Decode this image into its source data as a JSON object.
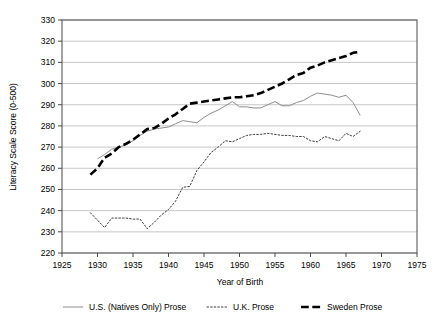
{
  "chart_data": {
    "type": "line",
    "title": "",
    "xlabel": "Year of Birth",
    "ylabel": "Literacy Scale Score (0-500)",
    "xlim": [
      1925,
      1975
    ],
    "ylim": [
      220,
      330
    ],
    "xticks": [
      1925,
      1930,
      1935,
      1940,
      1945,
      1950,
      1955,
      1960,
      1965,
      1970,
      1975
    ],
    "yticks": [
      220,
      230,
      240,
      250,
      260,
      270,
      280,
      290,
      300,
      310,
      320,
      330
    ],
    "grid": "horizontal",
    "legend_position": "bottom",
    "series": [
      {
        "name": "U.S. (Natives Only) Prose",
        "style": "solid",
        "color": "#808080",
        "width": 0.9,
        "x": [
          1930,
          1931,
          1932,
          1933,
          1934,
          1935,
          1936,
          1937,
          1938,
          1939,
          1940,
          1941,
          1942,
          1943,
          1944,
          1945,
          1946,
          1947,
          1948,
          1949,
          1950,
          1951,
          1952,
          1953,
          1954,
          1955,
          1956,
          1957,
          1958,
          1959,
          1960,
          1961,
          1962,
          1963,
          1964,
          1965,
          1966,
          1967
        ],
        "y": [
          264.5,
          266.5,
          269.0,
          270.0,
          271.0,
          273.0,
          275.5,
          277.5,
          278.5,
          279.0,
          279.5,
          281.0,
          282.5,
          282.0,
          281.5,
          284.0,
          286.0,
          287.5,
          289.5,
          291.5,
          289.0,
          289.0,
          288.5,
          288.5,
          290.0,
          291.5,
          289.5,
          289.5,
          291.0,
          292.0,
          294.0,
          295.5,
          295.0,
          294.5,
          293.5,
          294.5,
          291.0,
          285.0
        ]
      },
      {
        "name": "U.K. Prose",
        "style": "dotted",
        "color": "#3a3a3a",
        "width": 1.0,
        "x": [
          1929,
          1930,
          1931,
          1932,
          1933,
          1934,
          1935,
          1936,
          1937,
          1938,
          1939,
          1940,
          1941,
          1942,
          1943,
          1944,
          1945,
          1946,
          1947,
          1948,
          1949,
          1950,
          1951,
          1952,
          1953,
          1954,
          1955,
          1956,
          1957,
          1958,
          1959,
          1960,
          1961,
          1962,
          1963,
          1964,
          1965,
          1966,
          1967
        ],
        "y": [
          239.0,
          235.5,
          232.0,
          236.5,
          236.5,
          236.5,
          236.0,
          236.0,
          231.5,
          234.5,
          238.0,
          240.5,
          244.5,
          251.0,
          251.5,
          259.0,
          263.0,
          267.5,
          270.0,
          273.0,
          272.5,
          274.0,
          275.5,
          276.0,
          276.0,
          276.5,
          276.0,
          275.5,
          275.5,
          275.0,
          275.0,
          273.0,
          272.5,
          275.0,
          274.0,
          273.0,
          276.5,
          275.0,
          277.5
        ]
      },
      {
        "name": "Sweden Prose",
        "style": "dashed",
        "color": "#000000",
        "width": 2.6,
        "x": [
          1929,
          1930,
          1931,
          1932,
          1933,
          1934,
          1935,
          1936,
          1937,
          1938,
          1939,
          1940,
          1941,
          1942,
          1943,
          1944,
          1945,
          1946,
          1947,
          1948,
          1949,
          1950,
          1951,
          1952,
          1953,
          1954,
          1955,
          1956,
          1957,
          1958,
          1959,
          1960,
          1961,
          1962,
          1963,
          1964,
          1965,
          1966,
          1967
        ],
        "y": [
          257.0,
          260.0,
          265.0,
          267.0,
          270.0,
          271.5,
          273.5,
          276.0,
          278.5,
          279.0,
          281.0,
          283.5,
          285.5,
          288.0,
          290.5,
          291.0,
          291.5,
          292.0,
          292.5,
          293.0,
          293.5,
          293.5,
          294.0,
          294.5,
          295.5,
          297.0,
          298.5,
          300.0,
          302.0,
          304.0,
          305.0,
          307.5,
          308.5,
          310.0,
          311.0,
          312.0,
          313.0,
          314.5,
          315.0
        ]
      }
    ]
  }
}
